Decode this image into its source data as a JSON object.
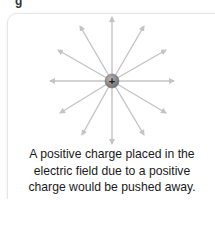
{
  "figure": {
    "label": "g",
    "charge": {
      "symbol": "+",
      "fill": "#8a8a8a",
      "label_color": "#1a1a1a"
    },
    "field_lines": {
      "count": 12,
      "color": "#c4c4c4",
      "direction": "outward"
    },
    "caption": {
      "line1": "A positive charge placed in the",
      "line2": "electric field due to a positive",
      "line3": "charge would be pushed away."
    }
  }
}
